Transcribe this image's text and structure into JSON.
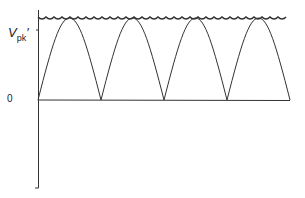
{
  "diagram": {
    "title": "",
    "labels": {
      "v_peak": "V",
      "v_peak_sub": "pk",
      "v_peak_prime": "′",
      "zero": "0"
    },
    "colors": {
      "stroke": "#333333",
      "background": "#ffffff"
    }
  }
}
